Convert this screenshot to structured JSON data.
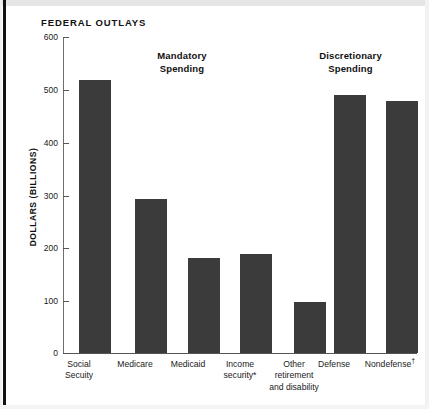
{
  "chart_data": {
    "type": "bar",
    "title": "FEDERAL OUTLAYS",
    "xlabel": "",
    "ylabel": "DOLLARS (BILLIONS)",
    "ylim": [
      0,
      600
    ],
    "yticks": [
      0,
      100,
      200,
      300,
      400,
      500,
      600
    ],
    "ytick_labels": [
      "0",
      "100",
      "200",
      "300",
      "400",
      "500",
      "600"
    ],
    "grid": false,
    "legend": null,
    "bar_color": "#3b3b3b",
    "background_color": "#ffffff",
    "categories": [
      "Social Secuity",
      "Medicare",
      "Medicaid",
      "Income security*",
      "Other retirement and disability",
      "Defense",
      "Nondefense†"
    ],
    "values": [
      518,
      292,
      180,
      188,
      97,
      490,
      478
    ],
    "groups": [
      {
        "label": "Mandatory Spending",
        "categories": [
          "Social Secuity",
          "Medicare",
          "Medicaid",
          "Income security*",
          "Other retirement and disability"
        ]
      },
      {
        "label": "Discretionary Spending",
        "categories": [
          "Defense",
          "Nondefense†"
        ]
      }
    ],
    "annotations": [
      "Mandatory Spending",
      "Discretionary Spending"
    ]
  },
  "chart": {
    "title": "FEDERAL OUTLAYS",
    "y_axis_title": "DOLLARS (BILLIONS)",
    "ticks": [
      "600",
      "500",
      "400",
      "300",
      "200",
      "100",
      "0"
    ],
    "groups": {
      "mandatory_line1": "Mandatory",
      "mandatory_line2": "Spending",
      "discretionary_line1": "Discretionary",
      "discretionary_line2": "Spending"
    },
    "categories": [
      {
        "line1": "Social",
        "line2": "Secuity",
        "line3": "",
        "value": 518
      },
      {
        "line1": "Medicare",
        "line2": "",
        "line3": "",
        "value": 292
      },
      {
        "line1": "Medicaid",
        "line2": "",
        "line3": "",
        "value": 180
      },
      {
        "line1": "Income",
        "line2": "security*",
        "line3": "",
        "value": 188
      },
      {
        "line1": "Other",
        "line2": "retirement",
        "line3": "and disability",
        "value": 97
      },
      {
        "line1": "Defense",
        "line2": "",
        "line3": "",
        "value": 490
      },
      {
        "line1": "Nondefense",
        "line2": "",
        "line3": "",
        "value": 478,
        "superscript": "†"
      }
    ]
  }
}
